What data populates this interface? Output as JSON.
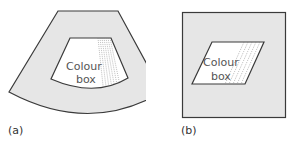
{
  "figure": {
    "panel_a": {
      "label": "(a)",
      "shape": "sector",
      "box_text_line1": "Colour",
      "box_text_line2": "box"
    },
    "panel_b": {
      "label": "(b)",
      "shape": "square",
      "box_text_line1": "Colour",
      "box_text_line2": "box"
    },
    "colors": {
      "field_fill": "#e6e6e6",
      "outline": "#3a3a3a",
      "box_fill": "#ffffff",
      "text": "#666666"
    }
  }
}
